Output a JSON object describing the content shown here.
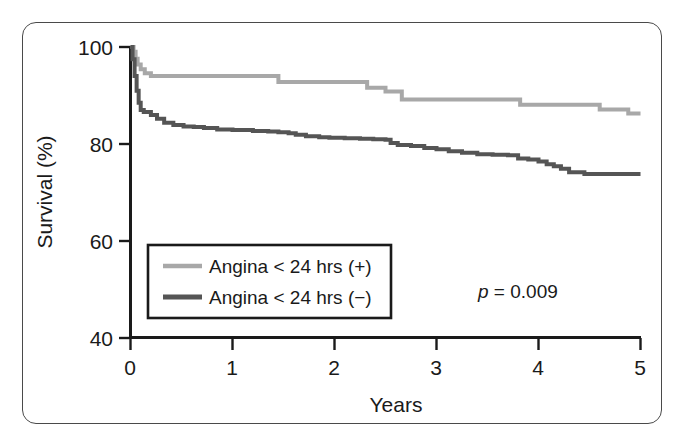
{
  "chart_data": {
    "type": "line",
    "subtype": "kaplan-meier-step",
    "title": "",
    "xlabel": "Years",
    "ylabel": "Survival (%)",
    "xlim": [
      0,
      5
    ],
    "ylim": [
      40,
      100
    ],
    "xticks": [
      0,
      1,
      2,
      3,
      4,
      5
    ],
    "xtick_labels": [
      "0",
      "1",
      "2",
      "3",
      "4",
      "5"
    ],
    "yticks": [
      40,
      60,
      80,
      100
    ],
    "ytick_labels": [
      "40",
      "60",
      "80",
      "100"
    ],
    "grid": false,
    "legend_position": "lower-left-inside",
    "annotations": [
      {
        "name": "p-value",
        "text_prefix": "p",
        "text_body": " = 0.009",
        "x": 3.8,
        "y": 51
      }
    ],
    "series": [
      {
        "name": "Angina < 24 hrs (+)",
        "color": "#a8a8a8",
        "linewidth": 4,
        "points": [
          [
            0.0,
            100.0
          ],
          [
            0.03,
            99.0
          ],
          [
            0.05,
            97.6
          ],
          [
            0.07,
            96.4
          ],
          [
            0.1,
            95.4
          ],
          [
            0.14,
            94.6
          ],
          [
            0.2,
            94.0
          ],
          [
            0.6,
            94.0
          ],
          [
            1.0,
            94.0
          ],
          [
            1.42,
            94.0
          ],
          [
            1.45,
            92.8
          ],
          [
            2.05,
            92.8
          ],
          [
            2.28,
            92.8
          ],
          [
            2.32,
            91.6
          ],
          [
            2.46,
            91.6
          ],
          [
            2.5,
            90.8
          ],
          [
            2.62,
            90.8
          ],
          [
            2.66,
            89.2
          ],
          [
            3.2,
            89.2
          ],
          [
            3.7,
            89.2
          ],
          [
            3.78,
            89.2
          ],
          [
            3.82,
            88.1
          ],
          [
            4.3,
            88.1
          ],
          [
            4.55,
            88.1
          ],
          [
            4.6,
            87.1
          ],
          [
            4.85,
            87.1
          ],
          [
            4.88,
            86.3
          ],
          [
            5.0,
            86.3
          ]
        ]
      },
      {
        "name": "Angina < 24 hrs (−)",
        "color": "#555555",
        "linewidth": 4,
        "points": [
          [
            0.0,
            100.0
          ],
          [
            0.02,
            97.5
          ],
          [
            0.04,
            94.0
          ],
          [
            0.06,
            91.0
          ],
          [
            0.08,
            88.5
          ],
          [
            0.1,
            87.0
          ],
          [
            0.13,
            86.6
          ],
          [
            0.16,
            86.6
          ],
          [
            0.2,
            86.0
          ],
          [
            0.26,
            85.2
          ],
          [
            0.33,
            84.4
          ],
          [
            0.42,
            83.9
          ],
          [
            0.52,
            83.6
          ],
          [
            0.62,
            83.5
          ],
          [
            0.72,
            83.3
          ],
          [
            0.85,
            83.0
          ],
          [
            1.0,
            82.9
          ],
          [
            1.2,
            82.7
          ],
          [
            1.35,
            82.6
          ],
          [
            1.45,
            82.4
          ],
          [
            1.55,
            82.2
          ],
          [
            1.62,
            81.9
          ],
          [
            1.72,
            81.6
          ],
          [
            1.85,
            81.4
          ],
          [
            1.95,
            81.3
          ],
          [
            2.1,
            81.2
          ],
          [
            2.25,
            81.1
          ],
          [
            2.38,
            81.0
          ],
          [
            2.5,
            80.9
          ],
          [
            2.55,
            80.2
          ],
          [
            2.62,
            79.8
          ],
          [
            2.75,
            79.6
          ],
          [
            2.88,
            79.2
          ],
          [
            3.0,
            78.9
          ],
          [
            3.12,
            78.5
          ],
          [
            3.25,
            78.2
          ],
          [
            3.4,
            77.9
          ],
          [
            3.55,
            77.8
          ],
          [
            3.7,
            77.7
          ],
          [
            3.8,
            77.0
          ],
          [
            3.9,
            76.8
          ],
          [
            4.0,
            76.4
          ],
          [
            4.08,
            75.8
          ],
          [
            4.15,
            75.4
          ],
          [
            4.22,
            74.9
          ],
          [
            4.3,
            74.2
          ],
          [
            4.45,
            73.8
          ],
          [
            4.7,
            73.8
          ],
          [
            5.0,
            73.8
          ]
        ]
      }
    ]
  },
  "axes": {
    "y_title": "Survival (%)",
    "x_title": "Years",
    "y_ticks": [
      {
        "label": "100",
        "value": 100
      },
      {
        "label": "80",
        "value": 80
      },
      {
        "label": "60",
        "value": 60
      },
      {
        "label": "40",
        "value": 40
      }
    ],
    "x_ticks": [
      {
        "label": "0",
        "value": 0
      },
      {
        "label": "1",
        "value": 1
      },
      {
        "label": "2",
        "value": 2
      },
      {
        "label": "3",
        "value": 3
      },
      {
        "label": "4",
        "value": 4
      },
      {
        "label": "5",
        "value": 5
      }
    ]
  },
  "legend": {
    "entries": [
      {
        "label": "Angina < 24 hrs (+)",
        "color": "#a8a8a8"
      },
      {
        "label": "Angina < 24 hrs (−)",
        "color": "#555555"
      }
    ]
  },
  "statistics": {
    "p_symbol": "p",
    "p_text": " = 0.009"
  },
  "colors": {
    "series_positive": "#a8a8a8",
    "series_negative": "#555555",
    "axis": "#1a1a1a",
    "frame": "#4a4a4a",
    "background": "#ffffff"
  }
}
